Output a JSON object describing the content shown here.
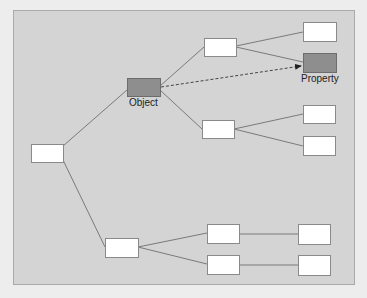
{
  "diagram": {
    "colors": {
      "page_background": "#ededed",
      "panel_background": "#d4d4d4",
      "node_fill": "#ffffff",
      "highlight_fill": "#8e8e8e",
      "edge": "#7a7a7a"
    },
    "nodes": [
      {
        "id": "root",
        "label": "",
        "highlight": false
      },
      {
        "id": "object",
        "label": "Object",
        "highlight": true
      },
      {
        "id": "upper-mid",
        "label": "",
        "highlight": false
      },
      {
        "id": "lower-mid",
        "label": "",
        "highlight": false
      },
      {
        "id": "right-top",
        "label": "",
        "highlight": false
      },
      {
        "id": "property",
        "label": "Property",
        "highlight": true
      },
      {
        "id": "right-3",
        "label": "",
        "highlight": false
      },
      {
        "id": "right-4",
        "label": "",
        "highlight": false
      },
      {
        "id": "bottom-mid",
        "label": "",
        "highlight": false
      },
      {
        "id": "bottom-branch-1",
        "label": "",
        "highlight": false
      },
      {
        "id": "bottom-branch-2",
        "label": "",
        "highlight": false
      },
      {
        "id": "bottom-leaf-1",
        "label": "",
        "highlight": false
      },
      {
        "id": "bottom-leaf-2",
        "label": "",
        "highlight": false
      }
    ],
    "edges": [
      {
        "from": "root",
        "to": "object",
        "style": "solid"
      },
      {
        "from": "root",
        "to": "bottom-mid",
        "style": "solid"
      },
      {
        "from": "object",
        "to": "upper-mid",
        "style": "solid"
      },
      {
        "from": "object",
        "to": "lower-mid",
        "style": "solid"
      },
      {
        "from": "object",
        "to": "property",
        "style": "dashed-arrow"
      },
      {
        "from": "upper-mid",
        "to": "right-top",
        "style": "solid"
      },
      {
        "from": "upper-mid",
        "to": "property",
        "style": "solid"
      },
      {
        "from": "lower-mid",
        "to": "right-3",
        "style": "solid"
      },
      {
        "from": "lower-mid",
        "to": "right-4",
        "style": "solid"
      },
      {
        "from": "bottom-mid",
        "to": "bottom-branch-1",
        "style": "solid"
      },
      {
        "from": "bottom-mid",
        "to": "bottom-branch-2",
        "style": "solid"
      },
      {
        "from": "bottom-branch-1",
        "to": "bottom-leaf-1",
        "style": "solid"
      },
      {
        "from": "bottom-branch-2",
        "to": "bottom-leaf-2",
        "style": "solid"
      }
    ],
    "labels": {
      "object": "Object",
      "property": "Property"
    }
  }
}
